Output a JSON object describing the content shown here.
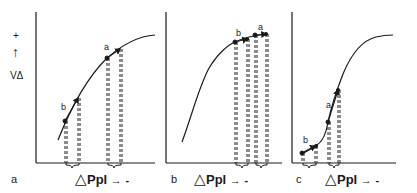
{
  "y_axis": {
    "plus_sign": "+",
    "arrow": "↑",
    "label": "ΔV"
  },
  "panels": [
    {
      "id": "a",
      "letter": "a",
      "x_label_triangle": "△",
      "x_label_text": "Ppl",
      "x_label_arrow": "→",
      "x_label_sign": "-",
      "points": [
        {
          "label": "b"
        },
        {
          "label": "a"
        }
      ]
    },
    {
      "id": "b",
      "letter": "b",
      "x_label_triangle": "△",
      "x_label_text": "Ppl",
      "x_label_arrow": "→",
      "x_label_sign": "-",
      "points": [
        {
          "label": "b"
        },
        {
          "label": "a"
        }
      ]
    },
    {
      "id": "c",
      "letter": "c",
      "x_label_triangle": "△",
      "x_label_text": "Ppl",
      "x_label_arrow": "→",
      "x_label_sign": "-",
      "points": [
        {
          "label": "b"
        },
        {
          "label": "a"
        }
      ]
    }
  ],
  "colors": {
    "ink": "#1a1a1a",
    "background": "#ffffff"
  }
}
